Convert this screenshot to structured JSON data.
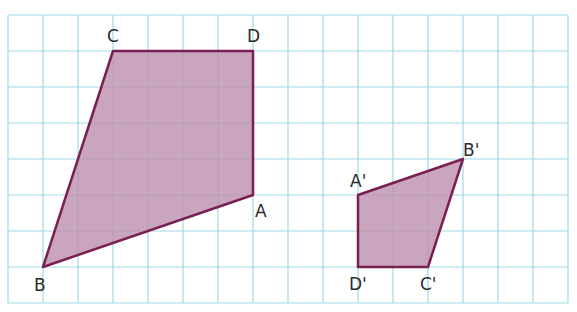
{
  "grid": {
    "origin_x": 8,
    "origin_y": 15,
    "cell_w": 35,
    "cell_h": 36,
    "cols": 16,
    "rows": 8,
    "line_color": "#9fd8e8",
    "border_color": "#9fd8e8"
  },
  "style": {
    "fill_color": "#bd8fae",
    "fill_opacity": 0.8,
    "stroke_color": "#7a1f52",
    "stroke_width": 2.5
  },
  "shapes": [
    {
      "name": "ABCD",
      "vertices": [
        {
          "label": "A",
          "col": 7,
          "row": 5,
          "dx": 2,
          "dy": 22
        },
        {
          "label": "B",
          "col": 1,
          "row": 7,
          "dx": -9,
          "dy": 24
        },
        {
          "label": "C",
          "col": 3,
          "row": 1,
          "dx": -6,
          "dy": -9
        },
        {
          "label": "D",
          "col": 7,
          "row": 1,
          "dx": -6,
          "dy": -9
        }
      ]
    },
    {
      "name": "A'B'C'D'",
      "vertices": [
        {
          "label": "A'",
          "col": 10,
          "row": 5,
          "dx": -8,
          "dy": -8
        },
        {
          "label": "B'",
          "col": 13,
          "row": 4,
          "dx": 0,
          "dy": -3
        },
        {
          "label": "C'",
          "col": 12,
          "row": 7,
          "dx": -8,
          "dy": 23
        },
        {
          "label": "D'",
          "col": 10,
          "row": 7,
          "dx": -9,
          "dy": 23
        }
      ]
    }
  ]
}
